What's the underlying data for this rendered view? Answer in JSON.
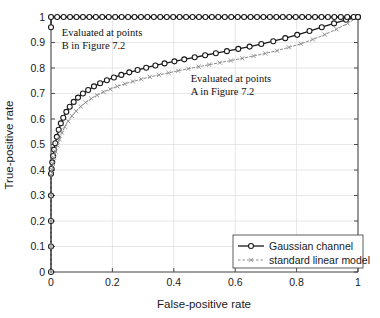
{
  "chart_data": {
    "type": "line",
    "title": "",
    "xlabel": "False-positive rate",
    "ylabel": "True-positive rate",
    "xlim": [
      0,
      1
    ],
    "ylim": [
      0,
      1
    ],
    "xticks": [
      "0",
      "0.2",
      "0.4",
      "0.6",
      "0.8",
      "1"
    ],
    "xtick_values": [
      0,
      0.2,
      0.4,
      0.6,
      0.8,
      1
    ],
    "yticks": [
      "0",
      "0.1",
      "0.2",
      "0.3",
      "0.4",
      "0.5",
      "0.6",
      "0.7",
      "0.8",
      "0.9",
      "1"
    ],
    "ytick_values": [
      0,
      0.1,
      0.2,
      0.3,
      0.4,
      0.5,
      0.6,
      0.7,
      0.8,
      0.9,
      1
    ],
    "grid": true,
    "legend_position": "lower right",
    "series": [
      {
        "name": "Gaussian channel",
        "style": "solid",
        "marker": "circle",
        "color": "#1a1a1a",
        "points": [
          [
            0.0,
            0.0
          ],
          [
            0.0,
            0.1
          ],
          [
            0.0,
            0.2
          ],
          [
            0.0,
            0.3
          ],
          [
            0.0,
            0.385
          ],
          [
            0.002,
            0.405
          ],
          [
            0.004,
            0.43
          ],
          [
            0.007,
            0.455
          ],
          [
            0.01,
            0.48
          ],
          [
            0.014,
            0.505
          ],
          [
            0.019,
            0.53
          ],
          [
            0.025,
            0.558
          ],
          [
            0.032,
            0.583
          ],
          [
            0.04,
            0.605
          ],
          [
            0.05,
            0.628
          ],
          [
            0.061,
            0.648
          ],
          [
            0.074,
            0.667
          ],
          [
            0.088,
            0.684
          ],
          [
            0.104,
            0.7
          ],
          [
            0.121,
            0.714
          ],
          [
            0.14,
            0.728
          ],
          [
            0.16,
            0.74
          ],
          [
            0.182,
            0.752
          ],
          [
            0.205,
            0.763
          ],
          [
            0.229,
            0.773
          ],
          [
            0.255,
            0.783
          ],
          [
            0.282,
            0.792
          ],
          [
            0.31,
            0.801
          ],
          [
            0.34,
            0.81
          ],
          [
            0.37,
            0.818
          ],
          [
            0.402,
            0.826
          ],
          [
            0.434,
            0.834
          ],
          [
            0.468,
            0.842
          ],
          [
            0.502,
            0.85
          ],
          [
            0.537,
            0.858
          ],
          [
            0.573,
            0.866
          ],
          [
            0.61,
            0.875
          ],
          [
            0.647,
            0.884
          ],
          [
            0.685,
            0.894
          ],
          [
            0.724,
            0.905
          ],
          [
            0.763,
            0.917
          ],
          [
            0.802,
            0.93
          ],
          [
            0.842,
            0.945
          ],
          [
            0.882,
            0.96
          ],
          [
            0.922,
            0.975
          ],
          [
            0.961,
            0.989
          ],
          [
            1.0,
            1.0
          ]
        ]
      },
      {
        "name": "standard linear model",
        "style": "dashed",
        "marker": "x",
        "color": "#8c8c8c",
        "points": [
          [
            0.0,
            0.0
          ],
          [
            0.0,
            0.1
          ],
          [
            0.0,
            0.2
          ],
          [
            0.0,
            0.3
          ],
          [
            0.0,
            0.38
          ],
          [
            0.003,
            0.4
          ],
          [
            0.006,
            0.424
          ],
          [
            0.01,
            0.448
          ],
          [
            0.015,
            0.472
          ],
          [
            0.021,
            0.496
          ],
          [
            0.028,
            0.52
          ],
          [
            0.036,
            0.546
          ],
          [
            0.045,
            0.57
          ],
          [
            0.056,
            0.591
          ],
          [
            0.068,
            0.612
          ],
          [
            0.082,
            0.631
          ],
          [
            0.097,
            0.649
          ],
          [
            0.113,
            0.665
          ],
          [
            0.131,
            0.68
          ],
          [
            0.15,
            0.693
          ],
          [
            0.171,
            0.706
          ],
          [
            0.193,
            0.717
          ],
          [
            0.216,
            0.728
          ],
          [
            0.241,
            0.738
          ],
          [
            0.267,
            0.747
          ],
          [
            0.294,
            0.756
          ],
          [
            0.322,
            0.765
          ],
          [
            0.352,
            0.773
          ],
          [
            0.383,
            0.781
          ],
          [
            0.414,
            0.789
          ],
          [
            0.447,
            0.797
          ],
          [
            0.481,
            0.805
          ],
          [
            0.515,
            0.813
          ],
          [
            0.55,
            0.821
          ],
          [
            0.586,
            0.829
          ],
          [
            0.623,
            0.838
          ],
          [
            0.66,
            0.847
          ],
          [
            0.698,
            0.857
          ],
          [
            0.736,
            0.868
          ],
          [
            0.775,
            0.881
          ],
          [
            0.814,
            0.895
          ],
          [
            0.853,
            0.912
          ],
          [
            0.892,
            0.931
          ],
          [
            0.93,
            0.952
          ],
          [
            0.966,
            0.975
          ],
          [
            1.0,
            1.0
          ]
        ]
      },
      {
        "name": "perfect-detector top curve",
        "style": "solid",
        "marker": "circle",
        "color": "#1a1a1a",
        "points": [
          [
            0.0,
            0.96
          ],
          [
            0.0,
            1.0
          ],
          [
            0.02,
            1.0
          ],
          [
            0.041,
            1.0
          ],
          [
            0.062,
            1.0
          ],
          [
            0.083,
            1.0
          ],
          [
            0.104,
            1.0
          ],
          [
            0.125,
            1.0
          ],
          [
            0.146,
            1.0
          ],
          [
            0.167,
            1.0
          ],
          [
            0.188,
            1.0
          ],
          [
            0.209,
            1.0
          ],
          [
            0.23,
            1.0
          ],
          [
            0.251,
            1.0
          ],
          [
            0.272,
            1.0
          ],
          [
            0.293,
            1.0
          ],
          [
            0.314,
            1.0
          ],
          [
            0.335,
            1.0
          ],
          [
            0.356,
            1.0
          ],
          [
            0.377,
            1.0
          ],
          [
            0.398,
            1.0
          ],
          [
            0.419,
            1.0
          ],
          [
            0.44,
            1.0
          ],
          [
            0.461,
            1.0
          ],
          [
            0.482,
            1.0
          ],
          [
            0.503,
            1.0
          ],
          [
            0.524,
            1.0
          ],
          [
            0.545,
            1.0
          ],
          [
            0.566,
            1.0
          ],
          [
            0.587,
            1.0
          ],
          [
            0.608,
            1.0
          ],
          [
            0.629,
            1.0
          ],
          [
            0.65,
            1.0
          ],
          [
            0.671,
            1.0
          ],
          [
            0.692,
            1.0
          ],
          [
            0.713,
            1.0
          ],
          [
            0.734,
            1.0
          ],
          [
            0.755,
            1.0
          ],
          [
            0.776,
            1.0
          ],
          [
            0.797,
            1.0
          ],
          [
            0.818,
            1.0
          ],
          [
            0.839,
            1.0
          ],
          [
            0.86,
            1.0
          ],
          [
            0.881,
            1.0
          ],
          [
            0.902,
            1.0
          ],
          [
            0.923,
            1.0
          ],
          [
            0.944,
            1.0
          ],
          [
            0.965,
            1.0
          ],
          [
            0.986,
            1.0
          ],
          [
            1.0,
            1.0
          ]
        ]
      }
    ],
    "annotations": [
      {
        "id": "annotation-b",
        "lines": [
          "Evaluated at points",
          "B in Figure 7.2"
        ],
        "x": 0.035,
        "y": 0.925
      },
      {
        "id": "annotation-a",
        "lines": [
          "Evaluated at points",
          "A in Figure 7.2"
        ],
        "x": 0.455,
        "y": 0.745
      }
    ],
    "legend_entries": [
      {
        "label": "Gaussian channel",
        "style": "solid",
        "marker": "circle",
        "color": "#1a1a1a"
      },
      {
        "label": "standard linear model",
        "style": "dashed",
        "marker": "x",
        "color": "#8c8c8c"
      }
    ],
    "colors": {
      "gaussian": "#1a1a1a",
      "linear": "#8c8c8c",
      "grid": "#dcdcdc",
      "axis": "#4d4d4d",
      "background": "#ffffff"
    }
  }
}
